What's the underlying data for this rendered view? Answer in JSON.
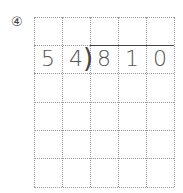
{
  "problem": {
    "number_label": "④",
    "divisor": [
      "5",
      "4"
    ],
    "dividend": [
      "8",
      "1",
      "0"
    ]
  },
  "grid": {
    "columns": 5,
    "rows": 6,
    "cell_size_px": 28,
    "line_color": "#999999",
    "line_style": "dotted"
  }
}
